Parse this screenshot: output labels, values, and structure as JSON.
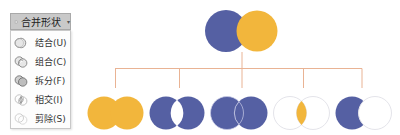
{
  "toolbar": {
    "merge_shapes_label": "合并形状",
    "dropdown_arrow": "▾"
  },
  "menu": {
    "items": [
      {
        "label": "结合(U)",
        "icon": "union-icon"
      },
      {
        "label": "组合(C)",
        "icon": "combine-icon"
      },
      {
        "label": "拆分(F)",
        "icon": "fragment-icon"
      },
      {
        "label": "相交(I)",
        "icon": "intersect-icon"
      },
      {
        "label": "剪除(S)",
        "icon": "subtract-icon"
      }
    ]
  },
  "diagram": {
    "colors": {
      "blue": "#5560a3",
      "yellow": "#f2b63c",
      "connector": "#e9b394",
      "outline": "#e4e4ea"
    },
    "source_shapes": [
      "blue-circle",
      "yellow-circle"
    ],
    "results": [
      "union",
      "combine",
      "fragment",
      "intersect",
      "subtract"
    ]
  }
}
